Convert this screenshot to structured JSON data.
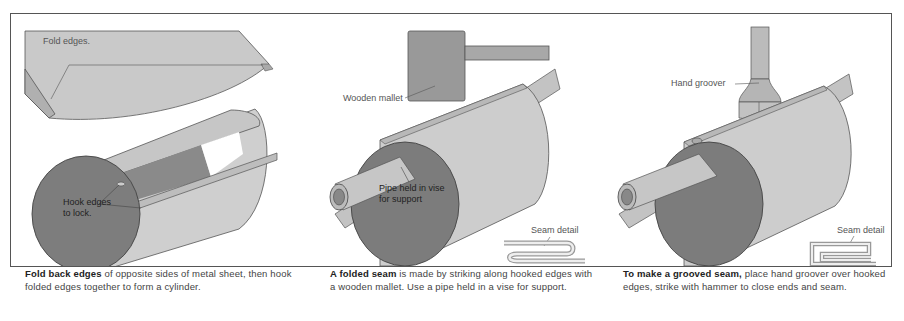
{
  "panels": [
    {
      "id": "fold-edges",
      "labels": {
        "fold_edges": "Fold edges.",
        "hook_line1": "Hook edges",
        "hook_line2": "to lock."
      },
      "caption": {
        "bold": "Fold back edges",
        "rest": " of opposite sides of metal sheet, then hook folded edges together to form a cylinder."
      }
    },
    {
      "id": "folded-seam",
      "labels": {
        "mallet": "Wooden mallet",
        "pipe_line1": "Pipe held in vise",
        "pipe_line2": "for support",
        "seam_detail": "Seam detail"
      },
      "caption": {
        "bold": "A folded seam",
        "rest": " is made by striking along hooked edges with a wooden mallet. Use a pipe held in a vise for support."
      }
    },
    {
      "id": "grooved-seam",
      "labels": {
        "groover": "Hand groover",
        "seam_detail": "Seam detail"
      },
      "caption": {
        "bold": "To make a grooved seam,",
        "rest": " place hand groover over hooked edges, strike with hammer to close ends and seam."
      }
    }
  ],
  "colors": {
    "sheet_light": "#c8c8c8",
    "sheet_mid": "#b4b4b4",
    "end_dark": "#7a7a7a",
    "outline": "#444444",
    "frame": "#555555"
  }
}
